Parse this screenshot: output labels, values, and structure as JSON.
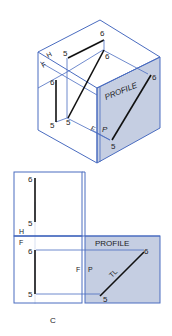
{
  "figure": {
    "caption": "C",
    "colors": {
      "frame_line": "#4a6cc0",
      "profile_fill": "#c5cee2",
      "object_line": "#111111",
      "text": "#222222"
    },
    "isometric_box": {
      "profile_plane_label": "PROFILE",
      "plane_labels": {
        "horizontal": "H",
        "frontal": "F",
        "frontal_hinge": "F",
        "profile_hinge": "P"
      },
      "points": {
        "top_5": "5",
        "top_6": "6",
        "front_6": "6",
        "front_5": "5",
        "back_6": "6",
        "back_5": "5",
        "profile_6": "6",
        "profile_5": "5"
      }
    },
    "orthographic": {
      "hinge_HF_top": "H",
      "hinge_HF_bottom": "F",
      "hinge_FP_left": "F",
      "hinge_FP_right": "P",
      "profile_label": "PROFILE",
      "true_length_label": "TL",
      "top_view": {
        "p6": "6",
        "p5": "5"
      },
      "front_view": {
        "p6": "6",
        "p5": "5"
      },
      "profile_view": {
        "p6": "6",
        "p5": "5"
      }
    }
  }
}
